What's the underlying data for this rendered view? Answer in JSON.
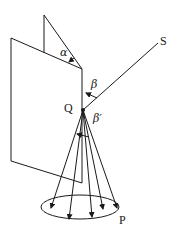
{
  "diagram": {
    "type": "geometry-optics",
    "labels": {
      "alpha": "α",
      "beta": "β",
      "beta_prime": "β′",
      "point_q": "Q",
      "point_s": "S",
      "point_p": "P"
    },
    "colors": {
      "stroke": "#1a1a1a",
      "background": "#ffffff"
    }
  }
}
